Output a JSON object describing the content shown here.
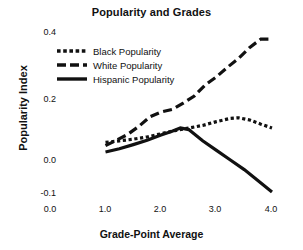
{
  "chart_data": {
    "type": "line",
    "title": "Popularity and Grades",
    "xlabel": "Grade-Point Average",
    "ylabel": "Popularity Index",
    "xlim": [
      0.0,
      4.3
    ],
    "ylim": [
      -0.13,
      0.43
    ],
    "xticks": [
      "0.0",
      "1.0",
      "2.0",
      "3.0",
      "4.0"
    ],
    "xtick_values": [
      0.0,
      1.0,
      2.0,
      3.0,
      4.0
    ],
    "yticks": [
      "0.4",
      "0.2",
      "0.0",
      "-0.1"
    ],
    "ytick_values": [
      0.4,
      0.2,
      0.0,
      -0.1
    ],
    "grid": false,
    "legend_position": "upper-left",
    "series": [
      {
        "name": "Black Popularity",
        "style": "dotted",
        "color": "#111111",
        "x": [
          1.0,
          1.25,
          1.5,
          1.75,
          2.0,
          2.25,
          2.5,
          2.75,
          3.0,
          3.25,
          3.4,
          3.6,
          3.8,
          4.0
        ],
        "y": [
          0.055,
          0.06,
          0.065,
          0.072,
          0.082,
          0.092,
          0.1,
          0.108,
          0.12,
          0.13,
          0.132,
          0.125,
          0.112,
          0.1
        ]
      },
      {
        "name": "White Popularity",
        "style": "dashed",
        "color": "#111111",
        "x": [
          1.0,
          1.2,
          1.4,
          1.6,
          1.8,
          2.0,
          2.2,
          2.4,
          2.6,
          2.8,
          3.0,
          3.2,
          3.4,
          3.6,
          3.8,
          4.0
        ],
        "y": [
          0.045,
          0.062,
          0.08,
          0.105,
          0.135,
          0.15,
          0.158,
          0.178,
          0.2,
          0.235,
          0.26,
          0.29,
          0.318,
          0.352,
          0.378,
          0.378
        ]
      },
      {
        "name": "Hispanic Popularity",
        "style": "solid",
        "color": "#111111",
        "x": [
          1.0,
          1.25,
          1.5,
          1.75,
          2.0,
          2.2,
          2.35,
          2.5,
          2.75,
          3.0,
          3.25,
          3.5,
          3.75,
          4.0
        ],
        "y": [
          0.025,
          0.035,
          0.048,
          0.062,
          0.078,
          0.09,
          0.1,
          0.095,
          0.06,
          0.03,
          0.0,
          -0.03,
          -0.065,
          -0.1
        ]
      }
    ]
  },
  "legend": {
    "items": [
      {
        "label": "Black Popularity",
        "style": "dotted"
      },
      {
        "label": "White Popularity",
        "style": "dashed"
      },
      {
        "label": "Hispanic Popularity",
        "style": "solid"
      }
    ]
  }
}
